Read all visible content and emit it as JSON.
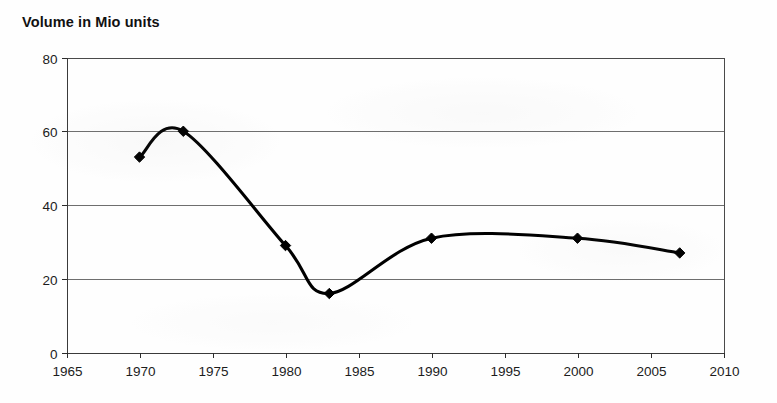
{
  "chart_data": {
    "type": "line",
    "title": "Volume in Mio units",
    "xlabel": "",
    "ylabel": "",
    "xlim": [
      1965,
      2010
    ],
    "ylim": [
      0,
      80
    ],
    "grid": true,
    "legend": "none",
    "x_ticks": [
      1965,
      1970,
      1975,
      1980,
      1985,
      1990,
      1995,
      2000,
      2005,
      2010
    ],
    "x_tick_labels": [
      "1965",
      "1970",
      "1975",
      "1980",
      "1985",
      "1990",
      "1995",
      "2000",
      "2005",
      "2010"
    ],
    "y_ticks": [
      0,
      20,
      40,
      60,
      80
    ],
    "y_tick_labels": [
      "0",
      "20",
      "40",
      "60",
      "80"
    ],
    "marker": "diamond",
    "line_color": "#000000",
    "series": [
      {
        "name": "Volume",
        "x": [
          1970,
          1973,
          1980,
          1983,
          1990,
          2000,
          2007
        ],
        "values": [
          53,
          60,
          29,
          16,
          31,
          31,
          27
        ]
      }
    ],
    "points": [
      {
        "x": 1970,
        "y": 53
      },
      {
        "x": 1973,
        "y": 60
      },
      {
        "x": 1980,
        "y": 29
      },
      {
        "x": 1983,
        "y": 16
      },
      {
        "x": 1990,
        "y": 31
      },
      {
        "x": 2000,
        "y": 31
      },
      {
        "x": 2007,
        "y": 27
      }
    ]
  }
}
